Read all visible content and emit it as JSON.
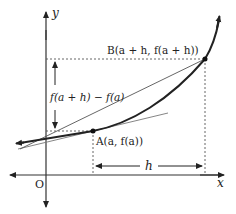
{
  "diagram": {
    "type": "secant-line-graph",
    "axes": {
      "x_label": "x",
      "y_label": "y",
      "origin_label": "O"
    },
    "points": {
      "A": {
        "label": "A(a, f(a))"
      },
      "B": {
        "label": "B(a + h, f(a + h))"
      }
    },
    "annotations": {
      "vertical_difference": "f(a + h) − f(a)",
      "horizontal_difference": "h"
    },
    "elements": [
      "curve y = f(x)",
      "secant line AB",
      "tangent line at A"
    ],
    "colors": {
      "curve": "#222222",
      "secant": "#555555",
      "tangent": "#777777",
      "axes": "#333333",
      "guides": "#555555"
    }
  }
}
